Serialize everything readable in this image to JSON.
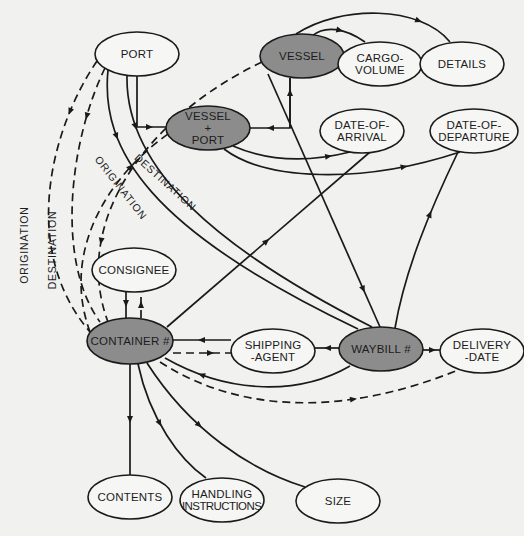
{
  "colors": {
    "background": "#f1f1ef",
    "entity_fill": "#8c8c8c",
    "attribute_fill": "#f6f6f4",
    "stroke": "#1a1a1a",
    "text": "#1c1c1c"
  },
  "nodes": [
    {
      "id": "port",
      "lines": [
        "PORT"
      ],
      "type": "attribute",
      "cx": 137,
      "cy": 54,
      "rx": 42,
      "ry": 22
    },
    {
      "id": "vessel",
      "lines": [
        "VESSEL"
      ],
      "type": "entity",
      "cx": 302,
      "cy": 56,
      "rx": 42,
      "ry": 22
    },
    {
      "id": "cargo-volume",
      "lines": [
        "CARGO-",
        "VOLUME"
      ],
      "type": "attribute",
      "cx": 380,
      "cy": 64,
      "rx": 42,
      "ry": 22
    },
    {
      "id": "details",
      "lines": [
        "DETAILS"
      ],
      "type": "attribute",
      "cx": 462,
      "cy": 64,
      "rx": 42,
      "ry": 22
    },
    {
      "id": "vessel-port",
      "lines": [
        "VESSEL",
        "+",
        "PORT"
      ],
      "type": "entity",
      "cx": 208,
      "cy": 128,
      "rx": 42,
      "ry": 22
    },
    {
      "id": "date-of-arrival",
      "lines": [
        "DATE-OF-",
        "ARRIVAL"
      ],
      "type": "attribute",
      "cx": 362,
      "cy": 131,
      "rx": 42,
      "ry": 22
    },
    {
      "id": "date-of-departure",
      "lines": [
        "DATE-OF-",
        "DEPARTURE"
      ],
      "type": "attribute",
      "cx": 474,
      "cy": 131,
      "rx": 44,
      "ry": 22
    },
    {
      "id": "consignee",
      "lines": [
        "CONSIGNEE"
      ],
      "type": "attribute",
      "cx": 134,
      "cy": 270,
      "rx": 42,
      "ry": 22
    },
    {
      "id": "container",
      "lines": [
        "CONTAINER #"
      ],
      "type": "entity",
      "cx": 130,
      "cy": 341,
      "rx": 43,
      "ry": 23
    },
    {
      "id": "shipping-agent",
      "lines": [
        "SHIPPING",
        "-AGENT"
      ],
      "type": "attribute",
      "cx": 273,
      "cy": 351,
      "rx": 42,
      "ry": 22
    },
    {
      "id": "waybill",
      "lines": [
        "WAYBILL #"
      ],
      "type": "entity",
      "cx": 381,
      "cy": 349,
      "rx": 42,
      "ry": 22
    },
    {
      "id": "delivery-date",
      "lines": [
        "DELIVERY",
        "-DATE"
      ],
      "type": "attribute",
      "cx": 482,
      "cy": 351,
      "rx": 42,
      "ry": 22
    },
    {
      "id": "contents",
      "lines": [
        "CONTENTS"
      ],
      "type": "attribute",
      "cx": 130,
      "cy": 497,
      "rx": 42,
      "ry": 22
    },
    {
      "id": "handling-instructions",
      "lines": [
        "HANDLING",
        "INSTRUCTIONS"
      ],
      "type": "attribute",
      "cx": 222,
      "cy": 500,
      "rx": 42,
      "ry": 22
    },
    {
      "id": "size",
      "lines": [
        "SIZE"
      ],
      "type": "attribute",
      "cx": 338,
      "cy": 501,
      "rx": 42,
      "ry": 22
    }
  ],
  "edges": [
    {
      "id": "port-to-vessel-port",
      "d": "M137,76 L137,127 L166,127",
      "dashed": false,
      "arrow": [
        150,
        127
      ]
    },
    {
      "id": "vessel-to-vessel-port",
      "d": "M290,78 L290,128 L250,128",
      "dashed": false,
      "arrow": [
        270,
        128
      ]
    },
    {
      "id": "vessel-port-to-vessel-up",
      "d": "M290,128 L290,78",
      "dashed": false,
      "arrow": [
        290,
        92
      ]
    },
    {
      "id": "vessel-to-cargo-volume",
      "d": "M312,36 C325,25 345,28 365,42",
      "dashed": false,
      "arrow": [
        340,
        31
      ]
    },
    {
      "id": "vessel-to-details",
      "d": "M296,34 C340,5 420,5 450,42",
      "dashed": false,
      "arrow": [
        420,
        19
      ]
    },
    {
      "id": "vessel-port-to-date-of-arrival",
      "d": "M233,146 C270,162 310,162 350,152",
      "dashed": false,
      "arrow": [
        330,
        158
      ]
    },
    {
      "id": "vessel-port-to-date-of-departure",
      "d": "M224,149 C265,180 360,185 460,152",
      "dashed": false,
      "arrow": [
        405,
        168
      ]
    },
    {
      "id": "vessel-to-waybill",
      "d": "M268,74 L380,327",
      "dashed": false,
      "arrow": [
        363,
        290
      ]
    },
    {
      "id": "waybill-to-date-of-departure",
      "d": "M395,328 C405,270 430,210 458,152",
      "dashed": false,
      "arrow": [
        438,
        216
      ]
    },
    {
      "id": "container-to-date-of-arrival",
      "d": "M167,327 L370,152",
      "dashed": false,
      "arrow": [
        267,
        240
      ]
    },
    {
      "id": "port-origination-solid",
      "d": "M108,70 C100,150 150,230 358,329",
      "dashed": false,
      "arrow": [
        110,
        140
      ]
    },
    {
      "id": "port-destination-solid",
      "d": "M127,76 C125,170 220,250 372,327",
      "dashed": false,
      "arrow": [
        130,
        130
      ]
    },
    {
      "id": "port-origination-dashed",
      "d": "M97,61 C50,130 20,250 90,332",
      "dashed": true,
      "arrow": [
        62,
        110
      ]
    },
    {
      "id": "port-destination-dashed",
      "d": "M105,68 C70,140 55,260 100,322",
      "dashed": true,
      "arrow": [
        84,
        115
      ]
    },
    {
      "id": "vessel-to-container-dashed",
      "d": "M262,62 C150,115 70,220 108,322",
      "dashed": true,
      "arrow": [
        92,
        240
      ]
    },
    {
      "id": "consignee-to-container",
      "d": "M126,292 L126,318",
      "dashed": false,
      "arrow": [
        126,
        305
      ]
    },
    {
      "id": "container-to-consignee-dashed",
      "d": "M141,318 L141,292",
      "dashed": true,
      "arrow": [
        141,
        304
      ]
    },
    {
      "id": "shipping-agent-to-container",
      "d": "M231,340 L173,340",
      "dashed": false,
      "arrow": [
        200,
        340
      ]
    },
    {
      "id": "container-to-shipping-agent-dashed",
      "d": "M173,353 L231,353",
      "dashed": true,
      "arrow": [
        212,
        353
      ]
    },
    {
      "id": "waybill-to-shipping-agent",
      "d": "M339,348 L315,348",
      "dashed": false,
      "arrow": [
        327,
        348
      ]
    },
    {
      "id": "waybill-to-delivery-date",
      "d": "M423,350 L440,350",
      "dashed": false,
      "arrow": [
        433,
        350
      ]
    },
    {
      "id": "waybill-to-container-curve",
      "d": "M350,366 C300,395 230,395 165,358",
      "dashed": false,
      "arrow": [
        200,
        375
      ]
    },
    {
      "id": "container-to-delivery-date-dashed",
      "d": "M160,362 C250,420 360,410 458,370",
      "dashed": true,
      "arrow": [
        355,
        403
      ]
    },
    {
      "id": "container-to-contents",
      "d": "M130,364 L130,475",
      "dashed": false,
      "arrow": [
        130,
        420
      ]
    },
    {
      "id": "container-to-handling",
      "d": "M138,364 C150,420 180,460 206,478",
      "dashed": false,
      "arrow": [
        163,
        422
      ]
    },
    {
      "id": "container-to-size",
      "d": "M147,363 C190,430 250,470 305,487",
      "dashed": false,
      "arrow": [
        200,
        425
      ]
    },
    {
      "id": "container-to-vessel-port-dashed",
      "d": "M90,332 C60,250 110,175 168,134",
      "dashed": true,
      "arrow": [
        135,
        170
      ]
    }
  ],
  "edge_labels": [
    {
      "id": "label-origination-outer",
      "text": "ORIGINATION",
      "x": 28,
      "y": 245,
      "rotate": -90
    },
    {
      "id": "label-destination-outer",
      "text": "DESTINATION",
      "x": 56,
      "y": 250,
      "rotate": -90
    },
    {
      "id": "label-origination-inner",
      "text": "ORIGINATION",
      "x": 118,
      "y": 190,
      "rotate": 52
    },
    {
      "id": "label-destination-inner",
      "text": "DESTINATION",
      "x": 163,
      "y": 185,
      "rotate": 42
    }
  ]
}
